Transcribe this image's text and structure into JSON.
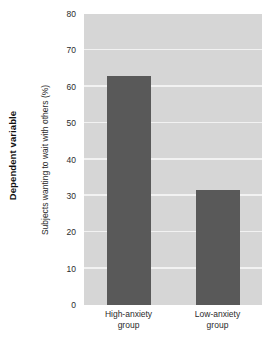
{
  "labels": {
    "dependent_variable": "Dependent variable"
  },
  "chart_data": {
    "type": "bar",
    "title": "",
    "xlabel": "",
    "ylabel": "Subjects wanting to wait with others (%)",
    "categories": [
      "High-anxiety group",
      "Low-anxiety group"
    ],
    "category_lines": [
      [
        "High-anxiety",
        "group"
      ],
      [
        "Low-anxiety",
        "group"
      ]
    ],
    "values": [
      63,
      31.5
    ],
    "ylim": [
      0,
      80
    ],
    "yticks": [
      0,
      10,
      20,
      30,
      40,
      50,
      60,
      70,
      80
    ],
    "ytick_labels": [
      "0",
      "10",
      "20",
      "30",
      "40",
      "50",
      "60",
      "70",
      "80"
    ],
    "grid": true,
    "legend": false,
    "colors": {
      "bar": "#595959",
      "plot_background": "#d6d6d6",
      "gridline": "#f2f2f2",
      "figure_background": "#ffffff",
      "text": "#2b2b2b"
    }
  }
}
